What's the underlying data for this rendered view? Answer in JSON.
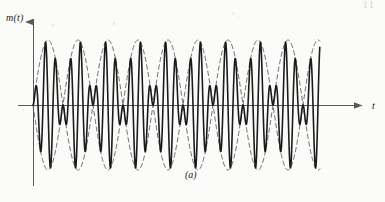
{
  "figure": {
    "caption": "(a)",
    "y_axis_label": "m(t)",
    "x_axis_label": "t",
    "page_header_mark": "11",
    "background_color": "#fbfbfa",
    "ink_color": "#1b1b1b",
    "envelope_color": "#4a4a4a",
    "axis_color": "#5a5a5a"
  },
  "chart_data": {
    "type": "line",
    "title": "",
    "subtitle": "",
    "xlabel": "t",
    "ylabel": "m(t)",
    "grid": false,
    "legend": null,
    "axis_origin_px": [
      33,
      105
    ],
    "x_axis_arrow": true,
    "y_axis_arrow": true,
    "xlim": [
      0,
      5
    ],
    "ylim": [
      -1.05,
      1.05
    ],
    "signal_start_x": 0.0,
    "signal_end_x": 4.78,
    "carrier_cycles_per_envelope_period": 6,
    "envelope_periods_shown": 5,
    "envelope_peak_count": 5,
    "series": [
      {
        "name": "modulated-signal",
        "style": "solid",
        "formula": "sin(2*pi*x) * sin(2*pi*6*x)",
        "amplitude": 1.0,
        "envelope_frequency": 1.0,
        "carrier_frequency": 6.0,
        "phase_reversals": true,
        "line_width_px": 1.6
      },
      {
        "name": "envelope-upper",
        "style": "dashed",
        "formula": "sin(2*pi*x)",
        "amplitude": 1.0,
        "frequency": 1.0,
        "line_width_px": 0.8
      },
      {
        "name": "envelope-lower",
        "style": "dashed",
        "formula": "-sin(2*pi*x)",
        "amplitude": 1.0,
        "frequency": 1.0,
        "line_width_px": 0.8
      }
    ],
    "envelope_peaks_x": [
      0.25,
      1.25,
      2.25,
      3.25,
      4.25
    ],
    "envelope_zeros_x": [
      0,
      0.5,
      1.0,
      1.5,
      2.0,
      2.5,
      3.0,
      3.5,
      4.0,
      4.5
    ],
    "pixels_per_unit_x": 60,
    "pixels_per_unit_y": 65
  }
}
